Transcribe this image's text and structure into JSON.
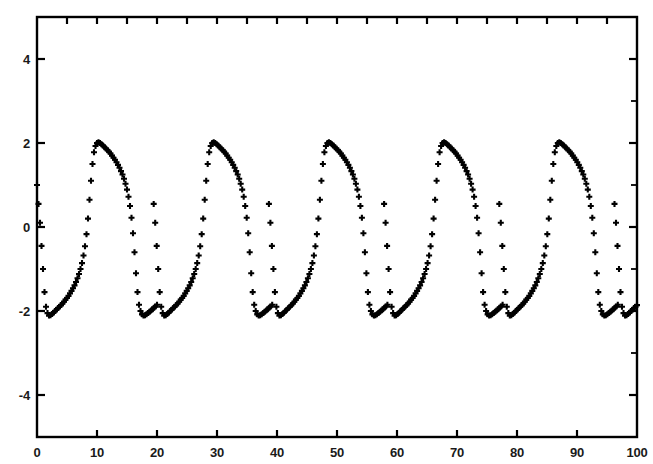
{
  "chart_data": {
    "type": "scatter",
    "title": "",
    "subtitle": "",
    "xlabel": "",
    "ylabel": "",
    "xlim": [
      0,
      100
    ],
    "ylim": [
      -5,
      5
    ],
    "grid": false,
    "legend": "none",
    "marker": "+",
    "marker_color": "#000000",
    "marker_size": 5,
    "x_ticks": [
      0,
      10,
      20,
      30,
      40,
      50,
      60,
      70,
      80,
      90,
      100
    ],
    "x_tick_labels": [
      "0",
      "10",
      "20",
      "30",
      "40",
      "50",
      "60",
      "70",
      "80",
      "90",
      "100"
    ],
    "y_ticks": [
      -4,
      -2,
      0,
      2,
      4
    ],
    "y_tick_labels": [
      "-4",
      "-2",
      "0",
      "2",
      "4"
    ],
    "y_minor_ticks": [
      -5,
      -3,
      -1,
      1,
      3,
      5
    ],
    "axis_color": "#000000",
    "frame": "box",
    "ticks_all_sides": true,
    "waveform": {
      "amplitude_max": 2.02,
      "amplitude_min": -2.12,
      "period": 19.2,
      "first_peak_x": 10.5,
      "first_trough_x": 19.7,
      "initial_value": 1.0,
      "peaks_x": [
        10.5,
        29.7,
        48.9,
        68.1,
        87.3
      ],
      "troughs_x": [
        19.7,
        38.9,
        58.1,
        77.3,
        96.5
      ],
      "n_cycles": 5.2,
      "sample_step": 0.25
    },
    "series": [
      {
        "name": "x(t)",
        "x": [
          0.0,
          0.25,
          0.5,
          0.75,
          1.0,
          1.25,
          1.5,
          1.75,
          2.0,
          2.25,
          2.5,
          2.75,
          3.0,
          3.25,
          3.5,
          3.75,
          4.0,
          4.25,
          4.5,
          4.75,
          5.0,
          5.25,
          5.5,
          5.75,
          6.0,
          6.25,
          6.5,
          6.75,
          7.0,
          7.25,
          7.5,
          7.75,
          8.0,
          8.25,
          8.5,
          8.75,
          9.0,
          9.25,
          9.5,
          9.75,
          10.0,
          10.25,
          10.5,
          10.75,
          11.0,
          11.25,
          11.5,
          11.75,
          12.0,
          12.25,
          12.5,
          12.75,
          13.0,
          13.25,
          13.5,
          13.75,
          14.0,
          14.25,
          14.5,
          14.75,
          15.0,
          15.25,
          15.5,
          15.75,
          16.0,
          16.25,
          16.5,
          16.75,
          17.0,
          17.25,
          17.5,
          17.75,
          18.0,
          18.25,
          18.5,
          18.75,
          19.0,
          19.25,
          19.5,
          19.75,
          20.0
        ],
        "y": [
          1.0,
          0.55,
          0.1,
          -0.45,
          -1.0,
          -1.55,
          -1.9,
          -2.05,
          -2.11,
          -2.1,
          -2.07,
          -2.04,
          -2.0,
          -1.97,
          -1.93,
          -1.9,
          -1.86,
          -1.82,
          -1.78,
          -1.73,
          -1.69,
          -1.64,
          -1.58,
          -1.52,
          -1.46,
          -1.39,
          -1.31,
          -1.22,
          -1.12,
          -1.0,
          -0.86,
          -0.68,
          -0.46,
          -0.17,
          0.2,
          0.65,
          1.1,
          1.5,
          1.78,
          1.93,
          2.0,
          2.02,
          2.0,
          1.97,
          1.94,
          1.9,
          1.87,
          1.83,
          1.79,
          1.75,
          1.7,
          1.65,
          1.6,
          1.54,
          1.48,
          1.41,
          1.33,
          1.25,
          1.15,
          1.03,
          0.89,
          0.72,
          0.5,
          0.22,
          -0.15,
          -0.6,
          -1.1,
          -1.55,
          -1.85,
          -2.0,
          -2.08,
          -2.11,
          -2.1,
          -2.08,
          -2.05,
          -2.02,
          -1.99,
          -1.96,
          -1.92,
          -1.89,
          -1.85
        ]
      }
    ]
  },
  "figure": {
    "background": "#ffffff",
    "ink": "#000000"
  }
}
